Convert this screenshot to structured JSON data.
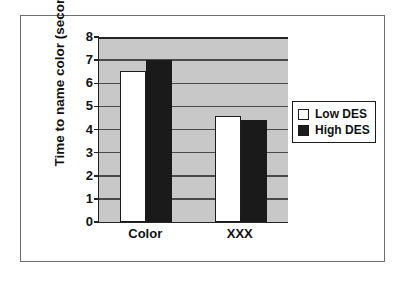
{
  "chart_data": {
    "type": "bar",
    "title": "",
    "subtitle": "",
    "xlabel": "",
    "ylabel": "Time to name color (seconds)",
    "categories": [
      "Color",
      "XXX"
    ],
    "series": [
      {
        "name": "Low DES",
        "values": [
          6.55,
          4.6
        ],
        "color": "#ffffff"
      },
      {
        "name": "High DES",
        "values": [
          7.0,
          4.4
        ],
        "color": "#1a1a1a"
      }
    ],
    "ylim": [
      0,
      8
    ],
    "ytick_labels": [
      "8",
      "7",
      "6",
      "5",
      "4",
      "3",
      "2",
      "1",
      "0"
    ],
    "ytick_values": [
      8,
      7,
      6,
      5,
      4,
      3,
      2,
      1,
      0
    ],
    "grid": true,
    "grid_axis": "y",
    "legend_position": "right",
    "plot_background": "#c8c8c8",
    "figure_background": "#ffffff",
    "axis_color": "#242424"
  },
  "legend": {
    "entries": [
      {
        "label": "Low DES",
        "swatch": "low"
      },
      {
        "label": "High DES",
        "swatch": "high"
      }
    ]
  }
}
